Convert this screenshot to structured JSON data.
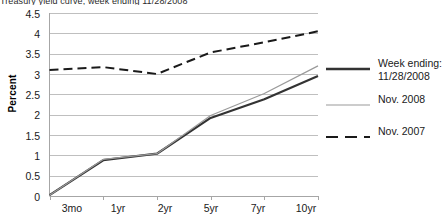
{
  "figure": {
    "title_clipped": "Treasury yield curve, week ending 11/28/2008"
  },
  "axes": {
    "ylabel": "Percent",
    "yticks": [
      "4.5",
      "4",
      "3.5",
      "3",
      "2.5",
      "2",
      "1.5",
      "1",
      "0.5",
      "0"
    ],
    "xticks": [
      "3mo",
      "1yr",
      "2yr",
      "5yr",
      "7yr",
      "10yr"
    ]
  },
  "legend": {
    "items": [
      {
        "label": "Week ending:\n11/28/2008",
        "style": "solid-thick",
        "color": "#333333",
        "swatch_name": "legend-swatch-week-ending"
      },
      {
        "label": "Nov. 2008",
        "style": "solid-thin",
        "color": "#9a9a9a",
        "swatch_name": "legend-swatch-nov-2008"
      },
      {
        "label": "Nov. 2007",
        "style": "dashed",
        "color": "#1a1a1a",
        "swatch_name": "legend-swatch-nov-2007"
      }
    ]
  },
  "colors": {
    "week_ending": "#333333",
    "nov_2008": "#9a9a9a",
    "nov_2007": "#1a1a1a",
    "grid": "#bfbfbf",
    "axis": "#a6a6a6",
    "background": "#ffffff"
  },
  "chart_data": {
    "type": "line",
    "title": "Treasury yield curve, week ending 11/28/2008",
    "xlabel": "",
    "ylabel": "Percent",
    "categories": [
      "3mo",
      "1yr",
      "2yr",
      "5yr",
      "7yr",
      "10yr"
    ],
    "ylim": [
      0,
      4.5
    ],
    "ytick_step": 0.5,
    "grid": true,
    "legend_position": "right",
    "series": [
      {
        "name": "Week ending: 11/28/2008",
        "style": "solid-thick",
        "color": "#333333",
        "values": [
          0.02,
          0.88,
          1.04,
          1.92,
          2.38,
          2.95
        ]
      },
      {
        "name": "Nov. 2008",
        "style": "solid-thin",
        "color": "#9a9a9a",
        "values": [
          0.02,
          0.9,
          1.04,
          1.98,
          2.52,
          3.2
        ]
      },
      {
        "name": "Nov. 2007",
        "style": "dashed",
        "color": "#1a1a1a",
        "values": [
          3.1,
          3.17,
          3.0,
          3.53,
          3.78,
          4.05
        ]
      }
    ]
  }
}
